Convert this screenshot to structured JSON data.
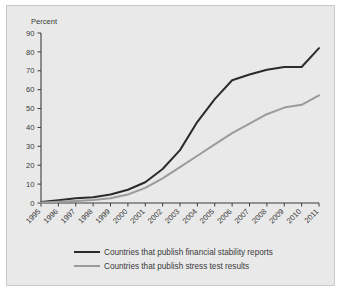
{
  "figure": {
    "background_color": "#ffffff",
    "panel_color": "#e9e9e9",
    "panel_border_color": "#c9c9c9"
  },
  "chart_data": {
    "type": "line",
    "title": "",
    "subtitle": "",
    "xlabel": "",
    "ylabel": "Percent",
    "ylim": [
      0,
      90
    ],
    "ytick_values": [
      0,
      10,
      20,
      30,
      40,
      50,
      60,
      70,
      80,
      90
    ],
    "ytick_labels": [
      "0",
      "10",
      "20",
      "30",
      "40",
      "50",
      "60",
      "70",
      "80",
      "90"
    ],
    "grid": false,
    "legend_position": "bottom",
    "x_tick_rotation": 45,
    "categories": [
      "1995",
      "1996",
      "1997",
      "1998",
      "1999",
      "2000",
      "2001",
      "2002",
      "2003",
      "2004",
      "2005",
      "2006",
      "2007",
      "2008",
      "2009",
      "2010",
      "2011"
    ],
    "x": [
      1995,
      1996,
      1997,
      1998,
      1999,
      2000,
      2001,
      2002,
      2003,
      2004,
      2005,
      2006,
      2007,
      2008,
      2009,
      2010,
      2011
    ],
    "series": [
      {
        "name": "Countries that publish financial stability reports",
        "color": "#2b2b2b",
        "linewidth": 2.0,
        "values": [
          0.5,
          1.5,
          2.5,
          3.0,
          4.5,
          7.0,
          11.0,
          18.0,
          28.0,
          43.0,
          55.0,
          65.0,
          68.0,
          70.5,
          72.0,
          72.0,
          82.0
        ]
      },
      {
        "name": "Countries that publish stress test results",
        "color": "#9b9b9b",
        "linewidth": 2.0,
        "values": [
          0.3,
          0.6,
          1.0,
          1.6,
          2.5,
          4.5,
          8.0,
          13.0,
          19.0,
          25.0,
          31.0,
          37.0,
          42.0,
          47.0,
          50.5,
          52.0,
          57.0
        ]
      }
    ]
  },
  "legend": {
    "entries": [
      {
        "label": "Countries that publish financial stability reports",
        "color": "#2b2b2b"
      },
      {
        "label": "Countries that publish stress test results",
        "color": "#9b9b9b"
      }
    ]
  }
}
